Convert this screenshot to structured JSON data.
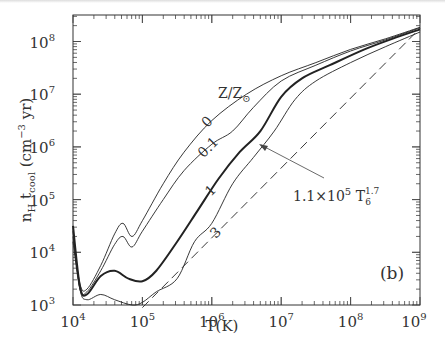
{
  "chart_data": {
    "type": "line",
    "title": "",
    "panel_label": "(b)",
    "xlabel": "T(K)",
    "ylabel": "n_H t_cool (cm^-3 yr)",
    "xscale": "log",
    "yscale": "log",
    "xlim": [
      10000,
      1000000000
    ],
    "ylim": [
      1000,
      300000000
    ],
    "x_tick_labels": [
      "10^4",
      "10^5",
      "10^6",
      "10^7",
      "10^8",
      "10^9"
    ],
    "y_tick_labels": [
      "10^3",
      "10^4",
      "10^5",
      "10^6",
      "10^7",
      "10^8"
    ],
    "legend_title": "Z/Z⊙",
    "series": [
      {
        "name": "0",
        "style": "thin",
        "log_points": [
          [
            4.0,
            4.3
          ],
          [
            4.1,
            3.4
          ],
          [
            4.2,
            3.3
          ],
          [
            4.4,
            3.75
          ],
          [
            4.6,
            4.35
          ],
          [
            4.72,
            4.55
          ],
          [
            4.85,
            4.3
          ],
          [
            5.0,
            4.6
          ],
          [
            5.3,
            5.3
          ],
          [
            5.6,
            5.9
          ],
          [
            6.0,
            6.5
          ],
          [
            6.5,
            7.0
          ],
          [
            7.0,
            7.35
          ],
          [
            7.5,
            7.6
          ],
          [
            8.0,
            7.85
          ],
          [
            8.5,
            8.05
          ],
          [
            9.0,
            8.27
          ]
        ]
      },
      {
        "name": "0.1",
        "style": "thin",
        "log_points": [
          [
            4.0,
            4.2
          ],
          [
            4.1,
            3.3
          ],
          [
            4.2,
            3.25
          ],
          [
            4.4,
            3.65
          ],
          [
            4.6,
            4.15
          ],
          [
            4.72,
            4.3
          ],
          [
            4.85,
            4.1
          ],
          [
            5.0,
            4.4
          ],
          [
            5.3,
            5.0
          ],
          [
            5.6,
            5.55
          ],
          [
            6.0,
            6.05
          ],
          [
            6.3,
            6.3
          ],
          [
            6.6,
            6.75
          ],
          [
            7.0,
            7.25
          ],
          [
            7.5,
            7.55
          ],
          [
            8.0,
            7.82
          ],
          [
            8.5,
            8.03
          ],
          [
            9.0,
            8.26
          ]
        ]
      },
      {
        "name": "1",
        "style": "bold",
        "log_points": [
          [
            4.0,
            4.5
          ],
          [
            4.1,
            3.35
          ],
          [
            4.2,
            3.2
          ],
          [
            4.4,
            3.55
          ],
          [
            4.6,
            3.65
          ],
          [
            4.8,
            3.5
          ],
          [
            5.0,
            3.45
          ],
          [
            5.2,
            3.65
          ],
          [
            5.5,
            4.2
          ],
          [
            5.8,
            4.8
          ],
          [
            6.1,
            5.4
          ],
          [
            6.4,
            5.9
          ],
          [
            6.7,
            6.3
          ],
          [
            7.0,
            6.95
          ],
          [
            7.3,
            7.3
          ],
          [
            7.7,
            7.55
          ],
          [
            8.2,
            7.85
          ],
          [
            8.6,
            8.05
          ],
          [
            9.0,
            8.23
          ]
        ]
      },
      {
        "name": "3",
        "style": "thin",
        "log_points": [
          [
            4.0,
            4.4
          ],
          [
            4.1,
            3.3
          ],
          [
            4.2,
            3.1
          ],
          [
            4.4,
            3.2
          ],
          [
            4.6,
            3.1
          ],
          [
            4.85,
            3.0
          ],
          [
            5.0,
            3.05
          ],
          [
            5.2,
            3.25
          ],
          [
            5.5,
            3.5
          ],
          [
            5.75,
            4.2
          ],
          [
            6.0,
            4.55
          ],
          [
            6.3,
            5.3
          ],
          [
            6.6,
            5.8
          ],
          [
            6.9,
            6.3
          ],
          [
            7.2,
            6.9
          ],
          [
            7.5,
            7.25
          ],
          [
            8.0,
            7.6
          ],
          [
            8.5,
            7.9
          ],
          [
            9.0,
            8.18
          ]
        ]
      },
      {
        "name": "1.1×10^5 T_6^1.7",
        "style": "dashed",
        "log_points": [
          [
            5.0,
            2.95
          ],
          [
            9.0,
            8.25
          ]
        ]
      }
    ],
    "annotations": [
      {
        "text": "Z/Z⊙",
        "x_px": 217,
        "y_px": 97
      },
      {
        "text": "0",
        "x_px": 205,
        "y_px": 122
      },
      {
        "text": "0.1",
        "x_px": 203,
        "y_px": 150
      },
      {
        "text": "1",
        "x_px": 210,
        "y_px": 192
      },
      {
        "text": "3",
        "x_px": 214,
        "y_px": 235
      },
      {
        "text": "1.1×10^5 T_6^1.7",
        "x_px": 290,
        "y_px": 188,
        "arrow_to_px": [
          259,
          145
        ]
      }
    ]
  }
}
